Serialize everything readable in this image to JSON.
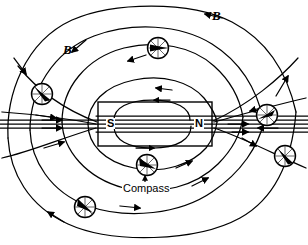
{
  "figure": {
    "background_color": "#ffffff",
    "line_color": "#000000",
    "width": 308,
    "height": 245
  },
  "magnet": {
    "south_pole_label": "S",
    "north_pole_label": "N",
    "fill_color": "#ffffff",
    "stroke_color": "#000000",
    "x": 98,
    "y": 102,
    "w": 114,
    "h": 44
  },
  "labels": {
    "field_label_right": "B",
    "field_label_left": "B",
    "compass_label": "Compass"
  },
  "compasses": [
    {
      "name": "compass-top",
      "cx": 158,
      "cy": 48,
      "r": 11,
      "needle_deg": 180
    },
    {
      "name": "compass-left-upper",
      "cx": 42,
      "cy": 94,
      "r": 11,
      "needle_deg": 216
    },
    {
      "name": "compass-right-upper",
      "cx": 267,
      "cy": 115,
      "r": 11,
      "needle_deg": 200
    },
    {
      "name": "compass-right-lower",
      "cx": 285,
      "cy": 156,
      "r": 11,
      "needle_deg": 232
    },
    {
      "name": "compass-bottom-center",
      "cx": 147,
      "cy": 165,
      "r": 11,
      "needle_deg": 25
    },
    {
      "name": "compass-bottom-left",
      "cx": 85,
      "cy": 207,
      "r": 11,
      "needle_deg": 42
    }
  ],
  "field_lines": {
    "description": "Closed magnetic field loops running from N pole around to S pole",
    "arrow_direction_above_magnet": "leftward",
    "arrow_direction_below_magnet": "rightward",
    "arrow_direction_inside_axis": "rightward (N to S through interior representation)",
    "loop_count_above": 4,
    "loop_count_below": 4,
    "horizontal_lines": 5
  }
}
